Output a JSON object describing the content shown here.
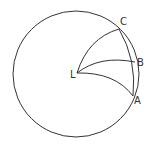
{
  "diagram": {
    "type": "geometry",
    "stroke_color": "#333333",
    "background": "#ffffff",
    "circle": {
      "cx": 76,
      "cy": 74,
      "r": 63
    },
    "points": [
      {
        "id": "L",
        "label": "L",
        "x": 77,
        "y": 73,
        "label_x": 70,
        "label_y": 78
      },
      {
        "id": "C",
        "label": "C",
        "x": 119,
        "y": 29,
        "label_x": 120,
        "label_y": 25
      },
      {
        "id": "B",
        "label": "B",
        "x": 135,
        "y": 62,
        "label_x": 137,
        "label_y": 66
      },
      {
        "id": "A",
        "label": "A",
        "x": 133,
        "y": 96,
        "label_x": 134,
        "label_y": 104
      }
    ],
    "arcs": [
      {
        "from": "L",
        "to": "C"
      },
      {
        "from": "L",
        "to": "B"
      },
      {
        "from": "L",
        "to": "A"
      },
      {
        "from": "C",
        "to": "A",
        "note": "inner arc close to circle boundary"
      }
    ]
  },
  "labels": {
    "L": "L",
    "A": "A",
    "B": "B",
    "C": "C"
  }
}
